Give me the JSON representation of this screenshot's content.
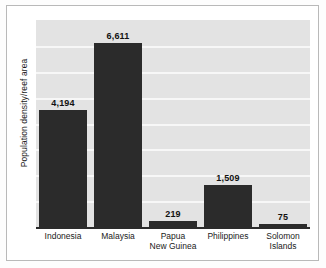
{
  "chart_data": {
    "type": "bar",
    "title": "",
    "xlabel": "",
    "ylabel": "Population density/reef area",
    "categories": [
      "Indonesia",
      "Malaysia",
      "Papua New Guinea",
      "Philippines",
      "Solomon Islands"
    ],
    "category_lines": [
      [
        "Indonesia"
      ],
      [
        "Malaysia"
      ],
      [
        "Papua",
        "New Guinea"
      ],
      [
        "Philippines"
      ],
      [
        "Solomon",
        "Islands"
      ]
    ],
    "values": [
      4194,
      6611,
      219,
      1509,
      75
    ],
    "value_labels": [
      "4,194",
      "6,611",
      "219",
      "1,509",
      "75"
    ],
    "ylim": [
      0,
      7000
    ],
    "grid": true,
    "gridline_count": 7,
    "legend": "none",
    "bar_color": "#2b2b2b",
    "plot_background": "#e3e3e3",
    "gridline_color": "#f7f7f7",
    "frame_color": "#b9b9b9"
  }
}
